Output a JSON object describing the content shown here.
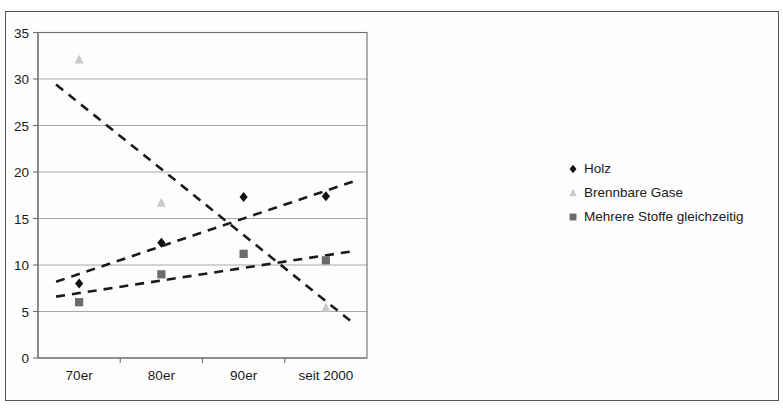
{
  "chart_data": {
    "type": "scatter",
    "title": "",
    "subtitle": "",
    "xlabel": "",
    "ylabel": "",
    "categories": [
      "70er",
      "80er",
      "90er",
      "seit 2000"
    ],
    "ylim": [
      0,
      35
    ],
    "yticks": [
      0,
      5,
      10,
      15,
      20,
      25,
      30,
      35
    ],
    "ytick_labels": [
      "0",
      "5",
      "10",
      "15",
      "20",
      "25",
      "30",
      "35"
    ],
    "grid": "horizontal",
    "legend_position": "right",
    "series": [
      {
        "name": "Holz",
        "marker": "diamond",
        "color": "#101010",
        "values": [
          8.0,
          12.4,
          17.3,
          17.4
        ],
        "trendline": {
          "style": "dashed",
          "color": "#1a1a1a",
          "y_start": 8.2,
          "y_end": 19.0
        }
      },
      {
        "name": "Brennbare Gase",
        "marker": "triangle",
        "color": "#c9c9c9",
        "values": [
          32.1,
          16.7,
          11.2,
          5.4
        ],
        "trendline": {
          "style": "dashed",
          "color": "#1a1a1a",
          "y_start": 29.4,
          "y_end": 3.7
        }
      },
      {
        "name": "Mehrere Stoffe gleichzeitig",
        "marker": "square",
        "color": "#6b6b6b",
        "values": [
          6.0,
          9.0,
          11.2,
          10.5
        ],
        "trendline": {
          "style": "dashed",
          "color": "#1a1a1a",
          "y_start": 6.6,
          "y_end": 11.5
        }
      }
    ]
  },
  "legend": {
    "items": [
      {
        "label": "Holz",
        "marker": "diamond",
        "color": "#101010"
      },
      {
        "label": "Brennbare Gase",
        "marker": "triangle",
        "color": "#c9c9c9"
      },
      {
        "label": "Mehrere Stoffe gleichzeitig",
        "marker": "square",
        "color": "#6b6b6b"
      }
    ]
  },
  "colors": {
    "grid": "#a8a8a8",
    "axis": "#6e6e6e",
    "frame": "#555555",
    "background": "#ffffff",
    "text": "#1a1a1a"
  }
}
